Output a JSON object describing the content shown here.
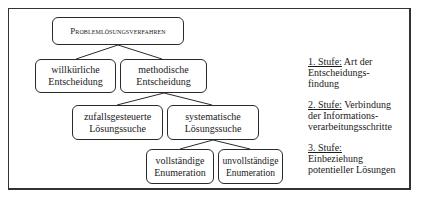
{
  "diagram": {
    "root": {
      "label": "Problemlösungsverfahren"
    },
    "level2": [
      {
        "label_line1": "willkürliche",
        "label_line2": "Entscheidung"
      },
      {
        "label_line1": "methodische",
        "label_line2": "Entscheidung"
      }
    ],
    "level3": [
      {
        "label_line1": "zufallsgesteuerte",
        "label_line2": "Lösungssuche"
      },
      {
        "label_line1": "systematische",
        "label_line2": "Lösungssuche"
      }
    ],
    "level4": [
      {
        "label_line1": "vollständige",
        "label_line2": "Enumeration"
      },
      {
        "label_line1": "unvollständige",
        "label_line2": "Enumeration"
      }
    ],
    "edges": [
      {
        "from": "Problemlösungsverfahren",
        "to": "willkürliche Entscheidung"
      },
      {
        "from": "Problemlösungsverfahren",
        "to": "methodische Entscheidung"
      },
      {
        "from": "methodische Entscheidung",
        "to": "zufallsgesteuerte Lösungssuche"
      },
      {
        "from": "methodische Entscheidung",
        "to": "systematische Lösungssuche"
      },
      {
        "from": "systematische Lösungssuche",
        "to": "vollständige Enumeration"
      },
      {
        "from": "systematische Lösungssuche",
        "to": "unvollständige Enumeration"
      }
    ]
  },
  "legend": {
    "steps": [
      {
        "title": "1. Stufe:",
        "text_line1": "Art der",
        "text_line2": "Entscheidungs-",
        "text_line3": "findung"
      },
      {
        "title": "2. Stufe:",
        "text_line1": "Verbindung",
        "text_line2": "der Informations-",
        "text_line3": "verarbeitungsschritte"
      },
      {
        "title": "3. Stufe:",
        "text_line1": "",
        "text_line2": "Einbeziehung",
        "text_line3": "potentieller Lösungen"
      }
    ]
  },
  "colors": {
    "line": "#2a2a2a",
    "frame": "#333333",
    "background": "#ffffff"
  }
}
